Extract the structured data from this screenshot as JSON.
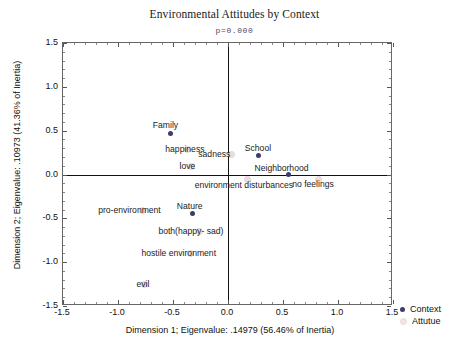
{
  "chart_data": {
    "type": "scatter",
    "title": "Environmental Attitudes by Context",
    "subtitle": "p=0.000",
    "xlabel": "Dimension 1; Eigenvalue: .14979 (56.46% of Inertia)",
    "ylabel": "Dimension 2; Eigenvalue: .10973 (41.36% of Inertia)",
    "xlim": [
      -1.5,
      1.5
    ],
    "ylim": [
      -1.5,
      1.5
    ],
    "xticks": [
      "-1.5",
      "-1.0",
      "-0.5",
      "0.0",
      "0.5",
      "1.0",
      "1.5"
    ],
    "xtick_values": [
      -1.5,
      -1.0,
      -0.5,
      0.0,
      0.5,
      1.0,
      1.5
    ],
    "yticks": [
      "1.5",
      "1.0",
      "0.5",
      "0.0",
      "-0.5",
      "-1.0",
      "-1.5"
    ],
    "ytick_values": [
      1.5,
      1.0,
      0.5,
      0.0,
      -0.5,
      -1.0,
      -1.5
    ],
    "grid": false,
    "legend_position": "right-bottom",
    "series": [
      {
        "name": "Context",
        "color": "#3c3c6e",
        "points": [
          {
            "label": "Family",
            "x": -0.52,
            "y": 0.47,
            "label_dx": -18,
            "label_dy": -12
          },
          {
            "label": "School",
            "x": 0.28,
            "y": 0.22,
            "label_dx": -14,
            "label_dy": -11
          },
          {
            "label": "Neighborhood",
            "x": 0.55,
            "y": 0.0,
            "label_dx": -34,
            "label_dy": -11
          },
          {
            "label": "Nature",
            "x": -0.32,
            "y": -0.45,
            "label_dx": -16,
            "label_dy": -12
          }
        ]
      },
      {
        "name": "Attutue",
        "color": "#eddede",
        "points": [
          {
            "label": "happiness",
            "x": -0.37,
            "y": 0.29,
            "label_dx": -22,
            "label_dy": -4
          },
          {
            "label": "love",
            "x": -0.34,
            "y": 0.1,
            "label_dx": -11,
            "label_dy": -4
          },
          {
            "label": "sadness",
            "x": 0.03,
            "y": 0.23,
            "label_dx": -33,
            "label_dy": -4
          },
          {
            "label": "environment disturbances",
            "x": 0.17,
            "y": -0.05,
            "label_dx": -52,
            "label_dy": 2
          },
          {
            "label": "no feelings",
            "x": 0.82,
            "y": -0.05,
            "label_dx": -26,
            "label_dy": 1
          },
          {
            "label": "pro-environment",
            "x": -0.78,
            "y": -0.4,
            "label_dx": -44,
            "label_dy": -4
          },
          {
            "label": "both(happy- sad)",
            "x": -0.26,
            "y": -0.64,
            "label_dx": -41,
            "label_dy": -4
          },
          {
            "label": "hostile environment",
            "x": -0.35,
            "y": -0.89,
            "label_dx": -48,
            "label_dy": -4
          },
          {
            "label": "evil",
            "x": -0.76,
            "y": -1.25,
            "label_dx": -8,
            "label_dy": -4
          }
        ]
      }
    ],
    "legend": [
      {
        "label": "Context",
        "color": "#3c3c6e"
      },
      {
        "label": "Attutue",
        "color": "#eddede"
      }
    ]
  }
}
